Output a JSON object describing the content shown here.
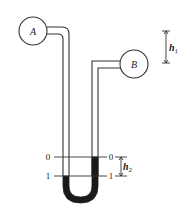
{
  "diagram": {
    "vessels": [
      {
        "id": "A",
        "label": "A"
      },
      {
        "id": "B",
        "label": "B"
      }
    ],
    "levels": {
      "upper_left": "0",
      "upper_right": "0",
      "lower_left": "1",
      "lower_right": "1"
    },
    "dimensions": {
      "h1": {
        "symbol": "h",
        "subscript": "1"
      },
      "h2": {
        "symbol": "h",
        "subscript": "2"
      }
    },
    "colors": {
      "line": "#333333",
      "fluid": "#1a1a1a",
      "background": "#ffffff"
    }
  }
}
